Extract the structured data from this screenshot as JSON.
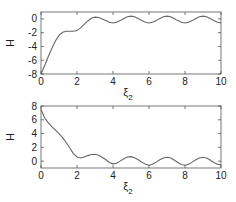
{
  "chart_data": [
    {
      "type": "line",
      "title": "",
      "xlabel": "ξ",
      "xlabel_sub": "2",
      "ylabel": "H",
      "xlim": [
        0,
        10
      ],
      "ylim": [
        -8,
        1
      ],
      "xticks": [
        0,
        2,
        4,
        6,
        8,
        10
      ],
      "yticks": [
        -8,
        -6,
        -4,
        -2,
        0
      ],
      "grid": false,
      "series": [
        {
          "name": "H",
          "color": "#666666",
          "x": [
            0,
            0.2,
            0.4,
            0.6,
            0.8,
            1.0,
            1.2,
            1.4,
            1.6,
            1.8,
            2.0,
            2.2,
            2.4,
            2.6,
            2.8,
            3.0,
            3.2,
            3.4,
            3.6,
            3.8,
            4.0,
            4.2,
            4.4,
            4.6,
            4.8,
            5.0,
            5.2,
            5.4,
            5.6,
            5.8,
            6.0,
            6.2,
            6.4,
            6.6,
            6.8,
            7.0,
            7.2,
            7.4,
            7.6,
            7.8,
            8.0,
            8.2,
            8.4,
            8.6,
            8.8,
            9.0,
            9.2,
            9.4,
            9.6,
            9.8,
            10.0
          ],
          "y": [
            -8,
            -6.8,
            -5.5,
            -4.3,
            -3.2,
            -2.4,
            -1.95,
            -1.8,
            -1.8,
            -1.8,
            -1.7,
            -1.3,
            -0.8,
            -0.3,
            0.1,
            0.25,
            0.2,
            0.0,
            -0.25,
            -0.5,
            -0.6,
            -0.5,
            -0.25,
            0.05,
            0.3,
            0.4,
            0.3,
            0.05,
            -0.25,
            -0.5,
            -0.6,
            -0.5,
            -0.25,
            0.05,
            0.3,
            0.4,
            0.3,
            0.05,
            -0.25,
            -0.5,
            -0.6,
            -0.5,
            -0.25,
            0.05,
            0.3,
            0.4,
            0.3,
            0.05,
            -0.25,
            -0.5,
            -0.6
          ]
        }
      ]
    },
    {
      "type": "line",
      "title": "",
      "xlabel": "ξ",
      "xlabel_sub": "2",
      "ylabel": "H",
      "xlim": [
        0,
        10
      ],
      "ylim": [
        -1,
        8
      ],
      "xticks": [
        0,
        2,
        4,
        6,
        8,
        10
      ],
      "yticks": [
        0,
        2,
        4,
        6,
        8
      ],
      "grid": false,
      "series": [
        {
          "name": "H",
          "color": "#666666",
          "x": [
            0,
            0.2,
            0.4,
            0.6,
            0.8,
            1.0,
            1.2,
            1.4,
            1.6,
            1.8,
            2.0,
            2.2,
            2.4,
            2.6,
            2.8,
            3.0,
            3.2,
            3.4,
            3.6,
            3.8,
            4.0,
            4.2,
            4.4,
            4.6,
            4.8,
            5.0,
            5.2,
            5.4,
            5.6,
            5.8,
            6.0,
            6.2,
            6.4,
            6.6,
            6.8,
            7.0,
            7.2,
            7.4,
            7.6,
            7.8,
            8.0,
            8.2,
            8.4,
            8.6,
            8.8,
            9.0,
            9.2,
            9.4,
            9.6,
            9.8,
            10.0
          ],
          "y": [
            7.5,
            6.3,
            5.6,
            5.0,
            4.5,
            4.0,
            3.4,
            2.7,
            1.9,
            1.1,
            0.6,
            0.45,
            0.6,
            0.8,
            0.95,
            1.0,
            0.85,
            0.55,
            0.2,
            -0.2,
            -0.4,
            -0.3,
            0.0,
            0.35,
            0.6,
            0.65,
            0.5,
            0.2,
            -0.15,
            -0.45,
            -0.6,
            -0.45,
            -0.15,
            0.2,
            0.45,
            0.55,
            0.45,
            0.15,
            -0.2,
            -0.5,
            -0.6,
            -0.45,
            -0.15,
            0.2,
            0.45,
            0.55,
            0.45,
            0.15,
            -0.2,
            -0.45,
            -0.55
          ]
        }
      ]
    }
  ]
}
